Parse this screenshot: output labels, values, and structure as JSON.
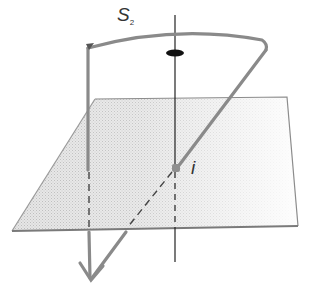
{
  "diagram": {
    "labels": {
      "s_main": "S",
      "s_sub": "2",
      "point": "i"
    },
    "colors": {
      "plane_fill": "#dcdcdc",
      "plane_edge": "#888888",
      "thick_line": "#8a8a8a",
      "axis": "#222222"
    },
    "elements": [
      "plane",
      "vertical-axis",
      "arc-path-s2",
      "ellipse-marker",
      "point-i",
      "downward-arrow"
    ]
  }
}
